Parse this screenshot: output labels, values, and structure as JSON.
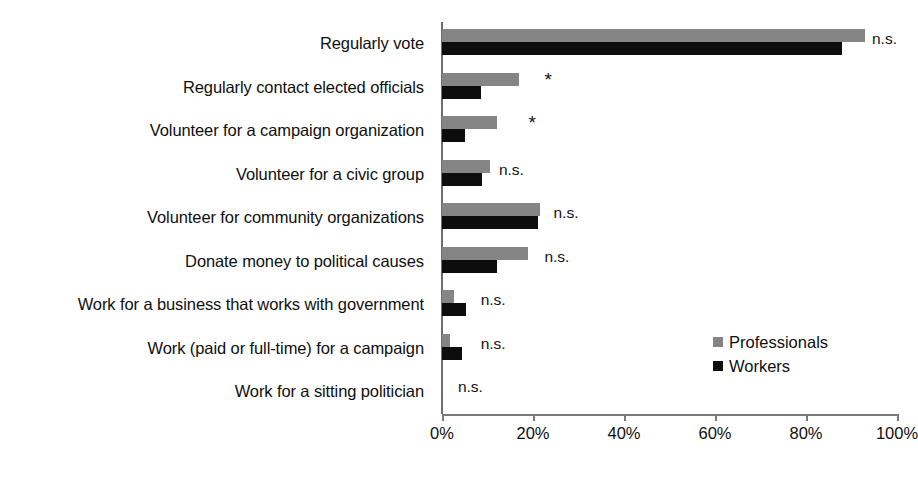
{
  "chart_data": {
    "type": "bar",
    "orientation": "horizontal",
    "title": "",
    "xlabel": "",
    "ylabel": "",
    "xlim": [
      0,
      100
    ],
    "grid": false,
    "legend_position": "inside-right",
    "xticks": [
      "0%",
      "20%",
      "40%",
      "60%",
      "80%",
      "100%"
    ],
    "xtick_values": [
      0,
      20,
      40,
      60,
      80,
      100
    ],
    "categories": [
      "Regularly vote",
      "Regularly contact elected officials",
      "Volunteer for a campaign organization",
      "Volunteer for a civic group",
      "Volunteer for community organizations",
      "Donate money to political causes",
      "Work for a business that works with government",
      "Work (paid or full-time) for a campaign",
      "Work for a sitting politician"
    ],
    "series": [
      {
        "name": "Professionals",
        "color": "#858585",
        "values": [
          93,
          17,
          12,
          10.5,
          21.5,
          19,
          2.6,
          1.8,
          0
        ]
      },
      {
        "name": "Workers",
        "color": "#0d0d0d",
        "values": [
          88,
          8.5,
          5,
          8.8,
          21,
          12,
          5.3,
          4.4,
          0
        ]
      }
    ],
    "annotations": [
      {
        "category": "Regularly vote",
        "text": "n.s.",
        "x": 94.5
      },
      {
        "category": "Regularly contact elected officials",
        "text": "*",
        "x": 22.5
      },
      {
        "category": "Volunteer for a campaign organization",
        "text": "*",
        "x": 19
      },
      {
        "category": "Volunteer for a civic group",
        "text": "n.s.",
        "x": 12.5
      },
      {
        "category": "Volunteer for community organizations",
        "text": "n.s.",
        "x": 24.5
      },
      {
        "category": "Donate money to political causes",
        "text": "n.s.",
        "x": 22.5
      },
      {
        "category": "Work for a business that works with government",
        "text": "n.s.",
        "x": 8.5
      },
      {
        "category": "Work (paid or full-time) for a campaign",
        "text": "n.s.",
        "x": 8.5
      },
      {
        "category": "Work for a sitting politician",
        "text": "n.s.",
        "x": 3.5
      }
    ]
  },
  "legend": {
    "items": [
      {
        "label": "Professionals",
        "color": "#858585"
      },
      {
        "label": "Workers",
        "color": "#0d0d0d"
      }
    ]
  }
}
